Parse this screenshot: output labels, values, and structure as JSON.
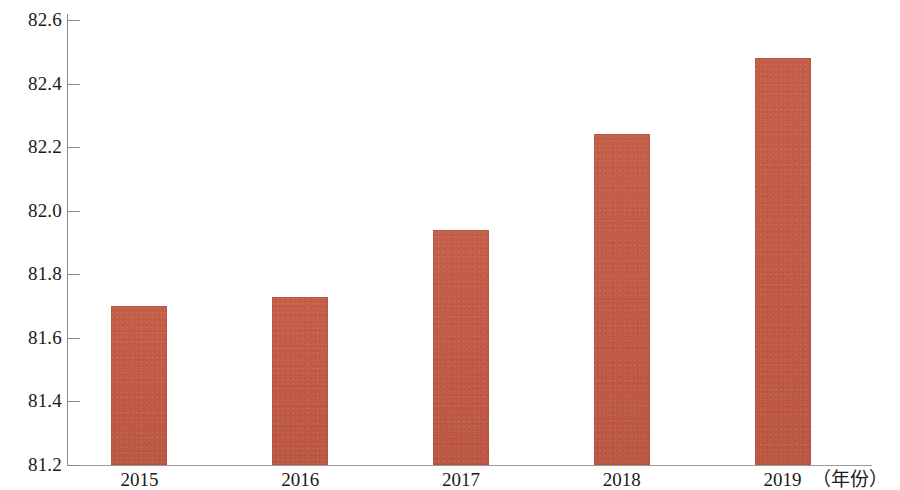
{
  "chart_data": {
    "type": "bar",
    "title": "",
    "subtitle": "",
    "xlabel": "（年份）",
    "ylabel": "",
    "categories": [
      "2015",
      "2016",
      "2017",
      "2018",
      "2019"
    ],
    "values": [
      81.7,
      81.73,
      81.94,
      82.24,
      82.48
    ],
    "series": [
      {
        "name": "",
        "values": [
          81.7,
          81.73,
          81.94,
          82.24,
          82.48
        ]
      }
    ],
    "ylim": [
      81.2,
      82.6
    ],
    "y_ticks": [
      "81.2",
      "81.4",
      "81.6",
      "81.8",
      "82.0",
      "82.2",
      "82.4",
      "82.6"
    ],
    "y_tick_values": [
      81.2,
      81.4,
      81.6,
      81.8,
      82.0,
      82.2,
      82.4,
      82.6
    ],
    "grid": false,
    "legend": null,
    "legend_position": "none",
    "bar_color": "#bf5a46",
    "axis_color": "#8c8c8c",
    "background_color": "#ffffff",
    "annotations": []
  },
  "axis": {
    "x_title": "（年份）"
  }
}
